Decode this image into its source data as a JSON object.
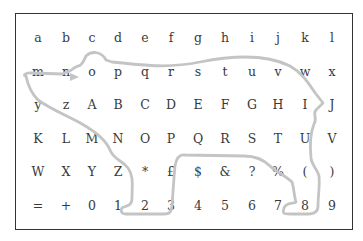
{
  "board": {
    "rows": [
      [
        "a",
        "b",
        "c",
        "d",
        "e",
        "f",
        "g",
        "h",
        "i",
        "j",
        "k",
        "l"
      ],
      [
        "m",
        "n",
        "o",
        "p",
        "q",
        "r",
        "s",
        "t",
        "u",
        "v",
        "w",
        "x"
      ],
      [
        "y",
        "z",
        "A",
        "B",
        "C",
        "D",
        "E",
        "F",
        "G",
        "H",
        "I",
        "J"
      ],
      [
        "K",
        "L",
        "M",
        "N",
        "O",
        "P",
        "Q",
        "R",
        "S",
        "T",
        "U",
        "V"
      ],
      [
        "W",
        "X",
        "Y",
        "Z",
        "*",
        "£",
        "$",
        "&",
        "?",
        "%",
        "(",
        ")"
      ],
      [
        "=",
        "+",
        "0",
        "1",
        "2",
        "3",
        "4",
        "5",
        "6",
        "7",
        "8",
        "9"
      ]
    ]
  },
  "overlay": {
    "shape": "polar-bear-outline",
    "color": "#c4c4c4"
  },
  "colors": {
    "border": "#333333",
    "text": "#3a3a3a"
  }
}
